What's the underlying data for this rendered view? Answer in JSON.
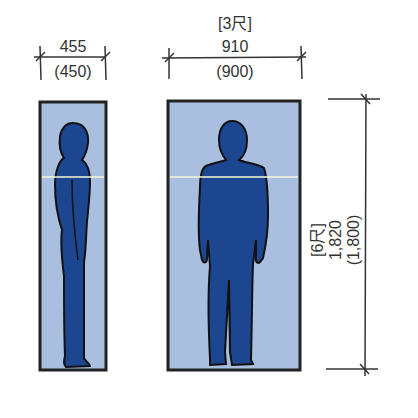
{
  "colors": {
    "panel_fill": "#a9bfe0",
    "figure_fill": "#1d4691",
    "outline": "#222222",
    "eye_line": "#f4f7d8",
    "dim_line": "#333333"
  },
  "side_view": {
    "width_label": "455",
    "width_alt_label": "(450)"
  },
  "front_view": {
    "width_shaku_label": "[3尺]",
    "width_label": "910",
    "width_alt_label": "(900)"
  },
  "height_dimension": {
    "shaku_label": "[6尺]",
    "height_label": "1,820",
    "height_alt_label": "(1,800)"
  }
}
